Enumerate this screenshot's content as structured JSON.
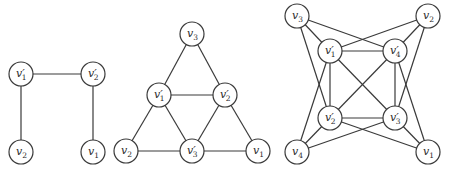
{
  "figure": {
    "graphs": [
      {
        "id": "g1",
        "nodes": [
          {
            "id": "a",
            "base": "v",
            "prime": true,
            "sub": "1",
            "x": 21,
            "y": 74
          },
          {
            "id": "b",
            "base": "v",
            "prime": true,
            "sub": "2",
            "x": 93,
            "y": 74
          },
          {
            "id": "c",
            "base": "v",
            "prime": false,
            "sub": "2",
            "x": 21,
            "y": 152
          },
          {
            "id": "d",
            "base": "v",
            "prime": false,
            "sub": "1",
            "x": 93,
            "y": 152
          }
        ],
        "edges": [
          [
            "a",
            "b"
          ],
          [
            "a",
            "c"
          ],
          [
            "b",
            "d"
          ]
        ]
      },
      {
        "id": "g2",
        "nodes": [
          {
            "id": "v3",
            "base": "v",
            "prime": false,
            "sub": "3",
            "x": 192,
            "y": 34
          },
          {
            "id": "p1",
            "base": "v",
            "prime": true,
            "sub": "1",
            "x": 159,
            "y": 95
          },
          {
            "id": "p2",
            "base": "v",
            "prime": true,
            "sub": "2",
            "x": 225,
            "y": 95
          },
          {
            "id": "v2",
            "base": "v",
            "prime": false,
            "sub": "2",
            "x": 126,
            "y": 151
          },
          {
            "id": "p3",
            "base": "v",
            "prime": true,
            "sub": "3",
            "x": 192,
            "y": 151
          },
          {
            "id": "v1",
            "base": "v",
            "prime": false,
            "sub": "1",
            "x": 258,
            "y": 151
          }
        ],
        "edges": [
          [
            "v3",
            "p1"
          ],
          [
            "v3",
            "p2"
          ],
          [
            "p1",
            "p2"
          ],
          [
            "p1",
            "v2"
          ],
          [
            "p1",
            "p3"
          ],
          [
            "p2",
            "p3"
          ],
          [
            "p2",
            "v1"
          ],
          [
            "v2",
            "p3"
          ],
          [
            "p3",
            "v1"
          ]
        ]
      },
      {
        "id": "g3",
        "nodes": [
          {
            "id": "v3",
            "base": "v",
            "prime": false,
            "sub": "3",
            "x": 297,
            "y": 16
          },
          {
            "id": "v2",
            "base": "v",
            "prime": false,
            "sub": "2",
            "x": 428,
            "y": 16
          },
          {
            "id": "p1",
            "base": "v",
            "prime": true,
            "sub": "1",
            "x": 330,
            "y": 51
          },
          {
            "id": "p4",
            "base": "v",
            "prime": true,
            "sub": "4",
            "x": 395,
            "y": 51
          },
          {
            "id": "p2",
            "base": "v",
            "prime": true,
            "sub": "2",
            "x": 330,
            "y": 118
          },
          {
            "id": "p3",
            "base": "v",
            "prime": true,
            "sub": "3",
            "x": 395,
            "y": 118
          },
          {
            "id": "v4",
            "base": "v",
            "prime": false,
            "sub": "4",
            "x": 297,
            "y": 152
          },
          {
            "id": "v1",
            "base": "v",
            "prime": false,
            "sub": "1",
            "x": 428,
            "y": 152
          }
        ],
        "edges": [
          [
            "p1",
            "p4"
          ],
          [
            "p1",
            "p2"
          ],
          [
            "p4",
            "p3"
          ],
          [
            "p2",
            "p3"
          ],
          [
            "p1",
            "p3"
          ],
          [
            "p4",
            "p2"
          ],
          [
            "v3",
            "p1"
          ],
          [
            "v3",
            "p2"
          ],
          [
            "v3",
            "p4"
          ],
          [
            "v2",
            "p4"
          ],
          [
            "v2",
            "p1"
          ],
          [
            "v2",
            "p3"
          ],
          [
            "v4",
            "p2"
          ],
          [
            "v4",
            "p1"
          ],
          [
            "v4",
            "p3"
          ],
          [
            "v1",
            "p3"
          ],
          [
            "v1",
            "p4"
          ],
          [
            "v1",
            "p2"
          ]
        ]
      }
    ],
    "style": {
      "node_radius": 12,
      "stroke_color": "#3a3a3a",
      "background": "#ffffff"
    }
  }
}
